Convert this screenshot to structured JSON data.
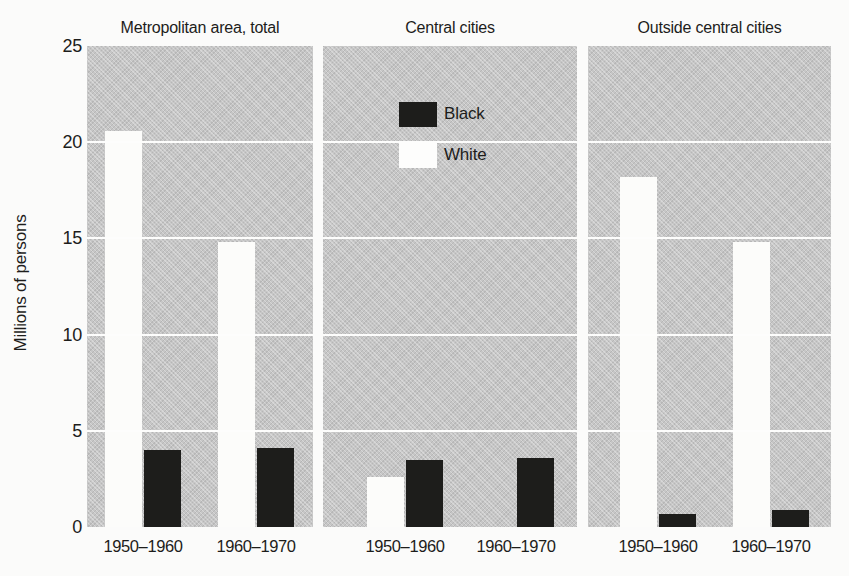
{
  "chart_data": {
    "type": "bar",
    "title": "",
    "ylabel": "Millions of persons",
    "ylim": [
      0,
      25
    ],
    "yticks": [
      0,
      5,
      10,
      15,
      20,
      25
    ],
    "grid": "horizontal-white-lines",
    "legend_position": "top-of-central-panel",
    "categories": [
      "1950–1960",
      "1960–1970"
    ],
    "series_names": [
      "Black",
      "White"
    ],
    "colors": {
      "black_bars": "#1d1d1b",
      "white_bars": "#fcfcfa",
      "panel_background": "#c6c6c6"
    },
    "legend": [
      {
        "label": "Black",
        "swatch_color": "#1d1d1b"
      },
      {
        "label": "White",
        "swatch_color": "#fdfdfc"
      }
    ],
    "panels": [
      {
        "title": "Metropolitan area, total",
        "groups": [
          {
            "category": "1950–1960",
            "White": 20.6,
            "Black": 4.0
          },
          {
            "category": "1960–1970",
            "White": 14.8,
            "Black": 4.1
          }
        ]
      },
      {
        "title": "Central cities",
        "groups": [
          {
            "category": "1950–1960",
            "White": 2.6,
            "Black": 3.5
          },
          {
            "category": "1960–1970",
            "White": null,
            "Black": 3.6
          }
        ]
      },
      {
        "title": "Outside central cities",
        "groups": [
          {
            "category": "1950–1960",
            "White": 18.2,
            "Black": 0.7
          },
          {
            "category": "1960–1970",
            "White": 14.8,
            "Black": 0.9
          }
        ]
      }
    ]
  }
}
